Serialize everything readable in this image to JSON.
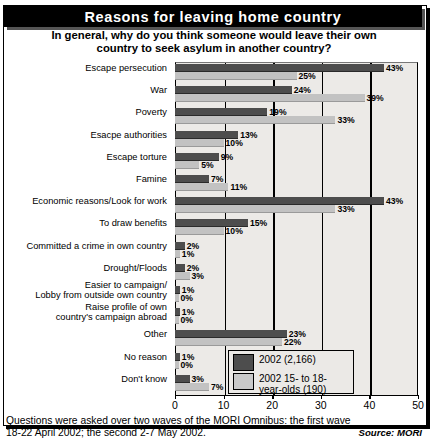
{
  "header": {
    "title": "Reasons for leaving home country",
    "subtitle_line1": "In general, why do you think someone would leave their own",
    "subtitle_line2": "country to seek asylum in another country?"
  },
  "legend": {
    "series_a_label": "2002 (2,166)",
    "series_b_label_line1": "2002 15- to 18-",
    "series_b_label_line2": "year-olds (190)"
  },
  "footer": {
    "note_line1": "Questions were asked over two waves of the MORI Omnibus: the first wave",
    "note_line2": "18-22 April 2002; the second 2-7 May 2002.",
    "source": "Source: MORI"
  },
  "colors": {
    "series_a": "#4d4d4d",
    "series_b": "#c2c2c2",
    "title_bar": "#000000",
    "plot_background": "#eceae7"
  },
  "chart_data": {
    "type": "bar",
    "orientation": "horizontal",
    "title": "Reasons for leaving home country",
    "subtitle": "In general, why do you think someone would leave their own country to seek asylum in another country?",
    "xlabel": "",
    "ylabel": "",
    "xlim": [
      0,
      50
    ],
    "xticks": [
      0,
      10,
      20,
      30,
      40,
      50
    ],
    "grid": true,
    "legend_position": "bottom-right",
    "value_suffix": "%",
    "categories": [
      "Escape persecution",
      "War",
      "Poverty",
      "Esacpe authorities",
      "Escape torture",
      "Famine",
      "Economic reasons/Look for work",
      "To draw benefits",
      "Committed a crime in own country",
      "Drought/Floods",
      "Easier to campaign/\nLobby from outside own country",
      "Raise profile of own\ncountry's campaign abroad",
      "Other",
      "No reason",
      "Don't know"
    ],
    "series": [
      {
        "name": "2002 (2,166)",
        "color": "#4d4d4d",
        "values": [
          43,
          24,
          19,
          13,
          9,
          7,
          43,
          15,
          2,
          2,
          1,
          1,
          23,
          1,
          3
        ],
        "labels": [
          "43%",
          "24%",
          "19%",
          "13%",
          "9%",
          "7%",
          "43%",
          "15%",
          "2%",
          "2%",
          "1%",
          "1%",
          "23%",
          "1%",
          "3%"
        ]
      },
      {
        "name": "2002 15- to 18-year-olds (190)",
        "color": "#c2c2c2",
        "values": [
          25,
          39,
          33,
          10,
          5,
          11,
          33,
          10,
          1,
          3,
          0,
          0,
          22,
          0,
          7
        ],
        "labels": [
          "25%",
          "39%",
          "33%",
          "10%",
          "5%",
          "11%",
          "33%",
          "10%",
          "1%",
          "3%",
          "0%",
          "0%",
          "22%",
          "0%",
          "7%"
        ]
      }
    ]
  }
}
